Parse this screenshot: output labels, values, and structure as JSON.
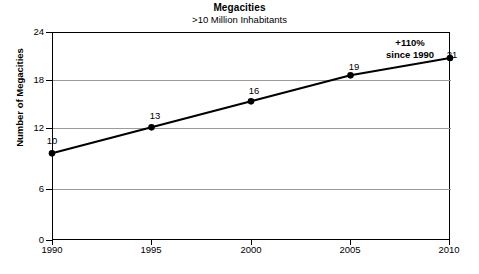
{
  "chart_data": {
    "type": "line",
    "title": "Megacities",
    "subtitle": ">10 Million Inhabitants",
    "xlabel": "",
    "ylabel": "Number of Megacities",
    "x": [
      1990,
      1995,
      2000,
      2005,
      2010
    ],
    "categories": [
      "1990",
      "1995",
      "2000",
      "2005",
      "2010"
    ],
    "values": [
      10,
      13,
      16,
      19,
      21
    ],
    "point_labels": [
      "10",
      "13",
      "16",
      "19",
      "21"
    ],
    "ylim": [
      0,
      24
    ],
    "yticks": [
      0,
      6,
      12,
      18,
      24
    ],
    "ytick_labels": [
      "0",
      "6",
      "12",
      "18",
      "24"
    ],
    "xlim": [
      1990,
      2010
    ],
    "grid": "horizontal",
    "legend": "none",
    "annotations": [
      {
        "line1": "+110%",
        "line2": "since 1990"
      }
    ],
    "colors": {
      "line": "#000000",
      "marker": "#000000",
      "grid": "#9a9a9a",
      "axis": "#000000",
      "background": "#ffffff"
    }
  }
}
